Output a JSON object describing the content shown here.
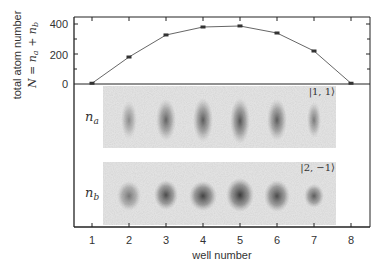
{
  "chart_data": [
    {
      "type": "line",
      "title": "",
      "xlabel": "well number",
      "ylabel": "total atom number",
      "ylabel_formula": "N = n_a + n_b",
      "x": [
        1,
        2,
        3,
        4,
        5,
        6,
        7,
        8
      ],
      "series": [
        {
          "name": "N = n_a + n_b",
          "values": [
            5,
            180,
            327,
            380,
            387,
            340,
            220,
            5
          ],
          "marker": "square",
          "color": "#555555"
        }
      ],
      "yticks": [
        0,
        200,
        400
      ],
      "ylim": [
        0,
        420
      ],
      "xlim": [
        0.5,
        8.5
      ],
      "xticks": [
        1,
        2,
        3,
        4,
        5,
        6,
        7,
        8
      ],
      "grid": false,
      "legend": null
    },
    {
      "type": "heatmap",
      "description": "absorption images of atom clouds per well",
      "panels": [
        {
          "label": "n_a",
          "state": "|1,1⟩",
          "wells": [
            2,
            3,
            4,
            5,
            6,
            7
          ],
          "relative_intensity": [
            0.45,
            0.7,
            0.75,
            0.8,
            0.75,
            0.55
          ]
        },
        {
          "label": "n_b",
          "state": "|2,−1⟩",
          "wells": [
            2,
            3,
            4,
            5,
            6,
            7
          ],
          "relative_intensity": [
            0.5,
            0.75,
            0.85,
            0.9,
            0.8,
            0.65
          ]
        }
      ]
    }
  ],
  "labels": {
    "ylabel_line1": "total atom number",
    "ylabel_line2": "N = nₐ + n_b",
    "xlabel": "well number",
    "ytick_0": "0",
    "ytick_200": "200",
    "ytick_400": "400",
    "xticks": [
      "1",
      "2",
      "3",
      "4",
      "5",
      "6",
      "7",
      "8"
    ],
    "panel_a_label": "n",
    "panel_a_sub": "a",
    "panel_b_label": "n",
    "panel_b_sub": "b",
    "panel_a_state": "|1, 1⟩",
    "panel_b_state": "|2, −1⟩"
  }
}
